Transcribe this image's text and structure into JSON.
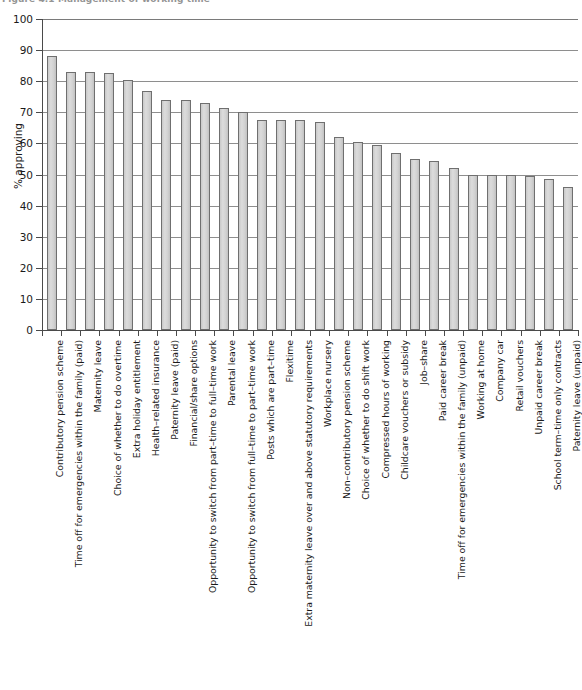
{
  "figure": {
    "caption": "Figure 4.1 Management of working time"
  },
  "chart_data": {
    "type": "bar",
    "title": "Figure 4.1 Management of working time",
    "xlabel": "",
    "ylabel": "% approving",
    "ylim": [
      0,
      100
    ],
    "ytick_step": 10,
    "yticks": [
      "0",
      "10",
      "20",
      "30",
      "40",
      "50",
      "60",
      "70",
      "80",
      "90",
      "100"
    ],
    "grid": true,
    "grid_axis": "y",
    "legend": "none",
    "orientation": "vertical",
    "bar_fill_color": "#d2d2d2",
    "bar_border_color": "#6f6f6f",
    "categories": [
      "Contributory pension scheme",
      "Time off for emergencies within the family (paid)",
      "Maternity leave",
      "Choice of whether to do overtime",
      "Extra holiday entitlement",
      "Health–related insurance",
      "Paternity leave (paid)",
      "Financial/share options",
      "Opportunity to switch from part–time to full–time work",
      "Parental leave",
      "Opportunity to switch from full–time to part–time work",
      "Posts which are part–time",
      "Flexitime",
      "Extra maternity leave over and above statutory requirements",
      "Workplace nursery",
      "Non–contributory pension scheme",
      "Choice of whether to do shift work",
      "Compressed hours of working",
      "Childcare vouchers or subsidy",
      "Job–share",
      "Paid career break",
      "Time off for emergencies within the family (unpaid)",
      "Working at home",
      "Company car",
      "Retail vouchers",
      "Unpaid career break",
      "School term–time only contracts",
      "Paternity leave (unpaid)"
    ],
    "values": [
      88,
      83,
      83,
      82.5,
      80.5,
      77,
      74,
      74,
      73,
      71.5,
      70,
      67.5,
      67.5,
      67.5,
      67,
      62,
      60.5,
      59.5,
      57,
      55,
      54.5,
      52,
      50,
      50,
      50,
      49.5,
      48.5,
      46
    ]
  }
}
